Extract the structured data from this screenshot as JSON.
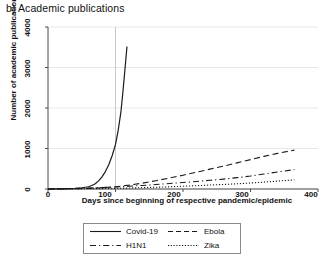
{
  "panel": {
    "title": "b) Academic publications"
  },
  "axes": {
    "ylabel": "Number of academic publications",
    "xlabel": "Days since beginning of respective pandemic/epidemic",
    "yticks": [
      "0",
      "1000",
      "2000",
      "3000",
      "4000"
    ],
    "xticks": [
      "0",
      "100",
      "200",
      "300",
      "400"
    ]
  },
  "legend": {
    "items": [
      {
        "label": "Covid-19",
        "style": "solid"
      },
      {
        "label": "Ebola",
        "style": "dashed"
      },
      {
        "label": "H1N1",
        "style": "dash-dot"
      },
      {
        "label": "Zika",
        "style": "dotted"
      }
    ]
  },
  "chart_data": {
    "type": "line",
    "title": "b) Academic publications",
    "xlabel": "Days since beginning of respective pandemic/epidemic",
    "ylabel": "Number of academic publications",
    "xlim": [
      0,
      400
    ],
    "ylim": [
      0,
      4000
    ],
    "xticks": [
      0,
      100,
      200,
      300,
      400
    ],
    "yticks": [
      0,
      1000,
      2000,
      3000,
      4000
    ],
    "grid": "horizontal-gridlines-plus-vertical-reference-at-100",
    "legend_position": "below-axes",
    "reference_line_x": 100,
    "series": [
      {
        "name": "Covid-19",
        "style": "solid",
        "x": [
          0,
          10,
          20,
          30,
          40,
          50,
          60,
          65,
          70,
          75,
          80,
          85,
          90,
          95,
          100,
          104,
          108,
          111,
          114,
          117
        ],
        "values": [
          0,
          2,
          5,
          10,
          18,
          30,
          55,
          85,
          130,
          200,
          300,
          430,
          600,
          820,
          1100,
          1450,
          1900,
          2400,
          2950,
          3520
        ]
      },
      {
        "name": "Ebola",
        "style": "dashed",
        "x": [
          0,
          20,
          40,
          60,
          80,
          100,
          120,
          140,
          160,
          180,
          200,
          220,
          240,
          260,
          280,
          300,
          320,
          340,
          365
        ],
        "values": [
          0,
          3,
          8,
          16,
          30,
          55,
          95,
          145,
          205,
          270,
          340,
          415,
          490,
          565,
          645,
          725,
          805,
          880,
          960
        ]
      },
      {
        "name": "H1N1",
        "style": "dash-dot",
        "x": [
          0,
          20,
          40,
          60,
          80,
          100,
          120,
          140,
          160,
          180,
          200,
          220,
          240,
          260,
          280,
          300,
          320,
          340,
          365
        ],
        "values": [
          0,
          5,
          12,
          22,
          35,
          50,
          68,
          88,
          110,
          135,
          160,
          185,
          215,
          245,
          280,
          320,
          370,
          420,
          480
        ]
      },
      {
        "name": "Zika",
        "style": "dotted",
        "x": [
          0,
          20,
          40,
          60,
          80,
          100,
          120,
          140,
          160,
          180,
          200,
          220,
          240,
          260,
          280,
          300,
          320,
          340,
          365
        ],
        "values": [
          0,
          1,
          3,
          6,
          10,
          16,
          24,
          33,
          43,
          55,
          68,
          82,
          97,
          112,
          128,
          148,
          170,
          195,
          225
        ]
      }
    ]
  }
}
